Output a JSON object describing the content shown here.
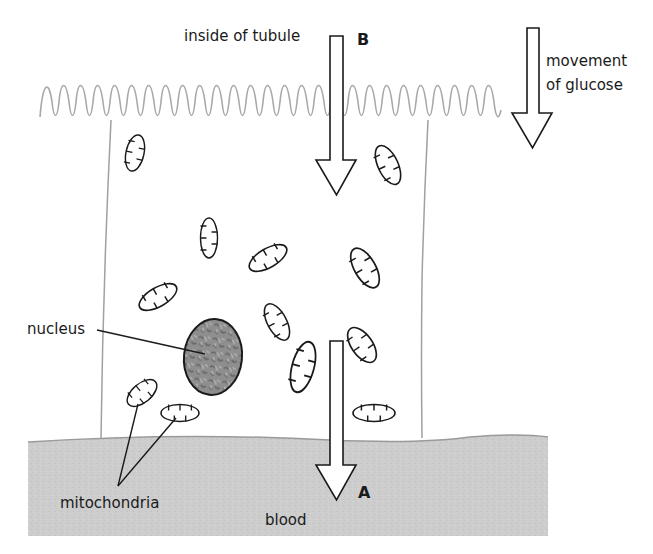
{
  "diagram": {
    "type": "biology-cell-diagram",
    "labels": {
      "inside_tubule": "inside of tubule",
      "movement_line1": "movement",
      "movement_line2": "of glucose",
      "point_b": "B",
      "point_a": "A",
      "nucleus": "nucleus",
      "mitochondria": "mitochondria",
      "blood": "blood"
    },
    "colors": {
      "blood_fill": "#cdcdcd",
      "blood_edge": "#9a9a9a",
      "microvilli": "#a8a8a8",
      "cell_wall": "#a0a0a0",
      "nucleus_fill": "#8e8e8e",
      "outline": "#1a1a1a"
    },
    "arrows": [
      {
        "id": "B",
        "direction": "down",
        "meaning": "glucose entering cell from tubule"
      },
      {
        "id": "A",
        "direction": "down",
        "meaning": "glucose leaving cell into blood"
      },
      {
        "id": "legend",
        "direction": "down",
        "meaning": "movement of glucose"
      }
    ],
    "mitochondria_count": 12
  }
}
